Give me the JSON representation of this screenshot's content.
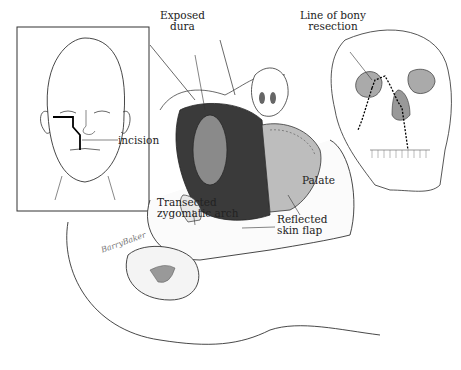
{
  "figure": {
    "inset_face": {
      "incision_label": "incision"
    },
    "labels": {
      "exposed_dura_line1": "Exposed",
      "exposed_dura_line2": "dura",
      "bony_resection_line1": "Line of bony",
      "bony_resection_line2": "resection",
      "palate": "Palate",
      "zygomatic_line1": "Transected",
      "zygomatic_line2": "zygomatic arch",
      "skin_flap_line1": "Reflected",
      "skin_flap_line2": "skin flap"
    },
    "signature": "BarryBaker",
    "colors": {
      "ink": "#222222",
      "background": "#ffffff",
      "cavity": "#3a3a3a"
    }
  }
}
